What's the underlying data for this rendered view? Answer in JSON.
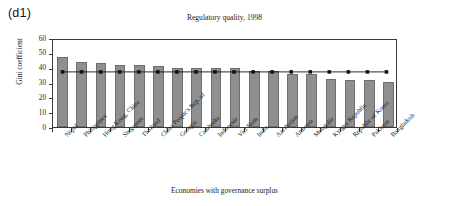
{
  "panel": {
    "tag": "(d1)"
  },
  "chart_data": {
    "type": "bar",
    "title": "Regulatory quality, 1998",
    "xlabel": "Economies with governance surplus",
    "ylabel": "Gini coefficient",
    "ylim": [
      0,
      60
    ],
    "yticks": [
      0,
      10,
      20,
      30,
      40,
      50,
      60
    ],
    "ytick_labels": [
      "0",
      "10",
      "20",
      "30",
      "40",
      "50",
      "60"
    ],
    "grid": false,
    "legend": "none",
    "categories": [
      "Nepal",
      "Philippines",
      "Hong Kong, China",
      "Singapore",
      "Thailand",
      "China People's Rep. of",
      "Georgia",
      "Cambodia",
      "Indonesia",
      "Viet Nam",
      "India",
      "Azerbaijan",
      "Armenia",
      "Mongolia",
      "Kyrgyz Republic",
      "Republic of Korea",
      "Pakistan",
      "Bangladesh"
    ],
    "series": [
      {
        "name": "Gini coefficient",
        "type": "bar",
        "color": "#8f8f8f",
        "values": [
          47.0,
          43.5,
          43.0,
          42.0,
          42.0,
          41.0,
          40.0,
          40.0,
          39.5,
          39.5,
          38.0,
          37.5,
          36.0,
          35.5,
          32.5,
          32.0,
          32.0,
          30.5
        ]
      },
      {
        "name": "Average",
        "type": "line",
        "color": "#111111",
        "marker": "square",
        "values": [
          38.0,
          38.0,
          38.0,
          38.0,
          38.0,
          38.0,
          38.0,
          38.0,
          38.0,
          38.0,
          38.0,
          38.0,
          38.0,
          38.0,
          38.0,
          38.0,
          38.0,
          38.0
        ]
      }
    ]
  }
}
